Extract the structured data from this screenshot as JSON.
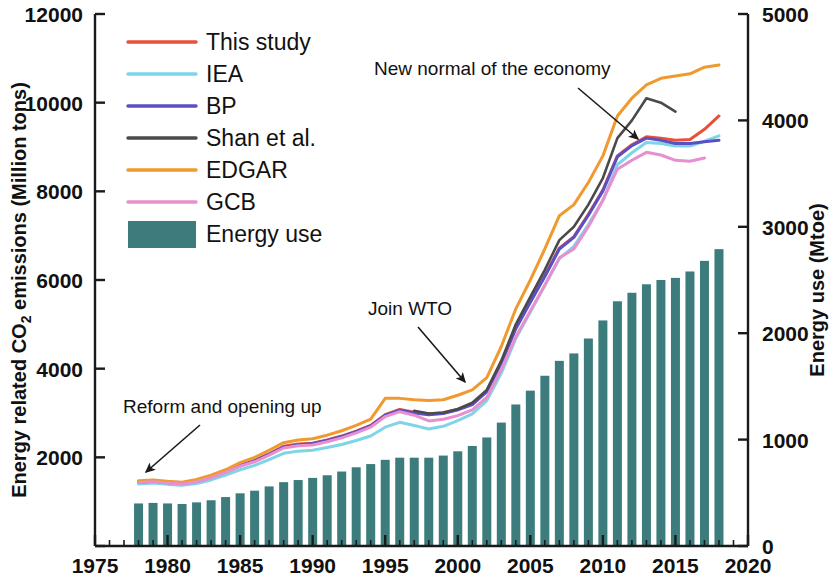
{
  "chart_data": {
    "type": "line",
    "title": "",
    "xlabel": "",
    "ylabel": "Energy related CO2 emissions (Million tons)",
    "y2label": "Energy use (Mtoe)",
    "xlim": [
      1975,
      2020
    ],
    "ylim": [
      0,
      12000
    ],
    "y2lim": [
      0,
      5000
    ],
    "xticks": [
      1975,
      1980,
      1985,
      1990,
      1995,
      2000,
      2005,
      2010,
      2015,
      2020
    ],
    "yticks": [
      0,
      2000,
      4000,
      6000,
      8000,
      10000,
      12000
    ],
    "y2ticks": [
      0,
      1000,
      2000,
      3000,
      4000,
      5000
    ],
    "grid": false,
    "legend_position": "top-left",
    "bars": {
      "name": "Energy use",
      "unit": "Mtoe",
      "axis": "right",
      "color": "#3d7c7c",
      "x": [
        1978,
        1979,
        1980,
        1981,
        1982,
        1983,
        1984,
        1985,
        1986,
        1987,
        1988,
        1989,
        1990,
        1991,
        1992,
        1993,
        1994,
        1995,
        1996,
        1997,
        1998,
        1999,
        2000,
        2001,
        2002,
        2003,
        2004,
        2005,
        2006,
        2007,
        2008,
        2009,
        2010,
        2011,
        2012,
        2013,
        2014,
        2015,
        2016,
        2017,
        2018
      ],
      "values": [
        400,
        405,
        400,
        395,
        410,
        430,
        460,
        495,
        520,
        560,
        600,
        620,
        640,
        665,
        700,
        740,
        770,
        810,
        830,
        830,
        830,
        850,
        890,
        940,
        1020,
        1160,
        1330,
        1460,
        1600,
        1740,
        1810,
        1950,
        2120,
        2300,
        2380,
        2460,
        2500,
        2520,
        2580,
        2680,
        2790
      ]
    },
    "series": [
      {
        "name": "This study",
        "color": "#e8503a",
        "axis": "left",
        "x": [
          1978,
          1979,
          1980,
          1981,
          1982,
          1983,
          1984,
          1985,
          1986,
          1987,
          1988,
          1989,
          1990,
          1991,
          1992,
          1993,
          1994,
          1995,
          1996,
          1997,
          1998,
          1999,
          2000,
          2001,
          2002,
          2003,
          2004,
          2005,
          2006,
          2007,
          2008,
          2009,
          2010,
          2011,
          2012,
          2013,
          2014,
          2015,
          2016,
          2017,
          2018
        ],
        "values": [
          1450,
          1470,
          1440,
          1420,
          1470,
          1560,
          1680,
          1820,
          1930,
          2080,
          2250,
          2300,
          2320,
          2390,
          2480,
          2590,
          2720,
          2960,
          3080,
          3020,
          2980,
          3000,
          3080,
          3200,
          3490,
          4140,
          4920,
          5520,
          6100,
          6720,
          6980,
          7480,
          8030,
          8800,
          9050,
          9230,
          9200,
          9150,
          9170,
          9400,
          9700
        ]
      },
      {
        "name": "IEA",
        "color": "#7fd4e8",
        "axis": "left",
        "x": [
          1978,
          1979,
          1980,
          1981,
          1982,
          1983,
          1984,
          1985,
          1986,
          1987,
          1988,
          1989,
          1990,
          1991,
          1992,
          1993,
          1994,
          1995,
          1996,
          1997,
          1998,
          1999,
          2000,
          2001,
          2002,
          2003,
          2004,
          2005,
          2006,
          2007,
          2008,
          2009,
          2010,
          2011,
          2012,
          2013,
          2014,
          2015,
          2016,
          2017,
          2018
        ],
        "values": [
          1400,
          1420,
          1390,
          1370,
          1410,
          1490,
          1600,
          1720,
          1820,
          1950,
          2090,
          2140,
          2160,
          2220,
          2290,
          2380,
          2480,
          2680,
          2790,
          2720,
          2640,
          2700,
          2830,
          2980,
          3280,
          3900,
          4680,
          5280,
          5880,
          6480,
          6760,
          7250,
          7800,
          8600,
          8870,
          9100,
          9080,
          9020,
          9020,
          9130,
          9250
        ]
      },
      {
        "name": "BP",
        "color": "#5b4fc4",
        "axis": "left",
        "x": [
          1978,
          1979,
          1980,
          1981,
          1982,
          1983,
          1984,
          1985,
          1986,
          1987,
          1988,
          1989,
          1990,
          1991,
          1992,
          1993,
          1994,
          1995,
          1996,
          1997,
          1998,
          1999,
          2000,
          2001,
          2002,
          2003,
          2004,
          2005,
          2006,
          2007,
          2008,
          2009,
          2010,
          2011,
          2012,
          2013,
          2014,
          2015,
          2016,
          2017,
          2018
        ],
        "values": [
          1440,
          1460,
          1430,
          1410,
          1460,
          1550,
          1670,
          1810,
          1920,
          2070,
          2230,
          2280,
          2310,
          2380,
          2470,
          2580,
          2710,
          2950,
          3060,
          3000,
          2960,
          2990,
          3070,
          3190,
          3480,
          4130,
          4900,
          5500,
          6080,
          6700,
          6960,
          7460,
          8010,
          8780,
          9030,
          9200,
          9150,
          9080,
          9080,
          9120,
          9150
        ]
      },
      {
        "name": "Shan et al.",
        "color": "#4a4a4a",
        "axis": "left",
        "x": [
          1997,
          1998,
          1999,
          2000,
          2001,
          2002,
          2003,
          2004,
          2005,
          2006,
          2007,
          2008,
          2009,
          2010,
          2011,
          2012,
          2013,
          2014,
          2015
        ],
        "values": [
          3050,
          2990,
          3010,
          3090,
          3230,
          3520,
          4180,
          5000,
          5620,
          6230,
          6900,
          7200,
          7700,
          8300,
          9200,
          9600,
          10100,
          10000,
          9800
        ]
      },
      {
        "name": "EDGAR",
        "color": "#f0992e",
        "axis": "left",
        "x": [
          1978,
          1979,
          1980,
          1981,
          1982,
          1983,
          1984,
          1985,
          1986,
          1987,
          1988,
          1989,
          1990,
          1991,
          1992,
          1993,
          1994,
          1995,
          1996,
          1997,
          1998,
          1999,
          2000,
          2001,
          2002,
          2003,
          2004,
          2005,
          2006,
          2007,
          2008,
          2009,
          2010,
          2011,
          2012,
          2013,
          2014,
          2015,
          2016,
          2017,
          2018
        ],
        "values": [
          1470,
          1490,
          1460,
          1440,
          1500,
          1600,
          1720,
          1880,
          2000,
          2160,
          2330,
          2390,
          2420,
          2500,
          2600,
          2720,
          2860,
          3330,
          3330,
          3300,
          3280,
          3300,
          3400,
          3520,
          3800,
          4500,
          5350,
          6000,
          6700,
          7450,
          7700,
          8200,
          8800,
          9700,
          10100,
          10400,
          10550,
          10600,
          10650,
          10800,
          10850
        ]
      },
      {
        "name": "GCB",
        "color": "#e88fd0",
        "axis": "left",
        "x": [
          1978,
          1979,
          1980,
          1981,
          1982,
          1983,
          1984,
          1985,
          1986,
          1987,
          1988,
          1989,
          1990,
          1991,
          1992,
          1993,
          1994,
          1995,
          1996,
          1997,
          1998,
          1999,
          2000,
          2001,
          2002,
          2003,
          2004,
          2005,
          2006,
          2007,
          2008,
          2009,
          2010,
          2011,
          2012,
          2013,
          2014,
          2015,
          2016,
          2017
        ],
        "values": [
          1430,
          1450,
          1420,
          1400,
          1450,
          1540,
          1660,
          1800,
          1900,
          2050,
          2210,
          2260,
          2280,
          2350,
          2440,
          2550,
          2680,
          2920,
          3030,
          2950,
          2820,
          2860,
          2940,
          3070,
          3350,
          3980,
          4720,
          5300,
          5880,
          6500,
          6700,
          7200,
          7800,
          8500,
          8700,
          8880,
          8820,
          8700,
          8680,
          8750
        ]
      }
    ],
    "annotations": [
      {
        "text": "Reform and opening up",
        "label_x": 123,
        "label_y": 413,
        "arrow_from_x": 200,
        "arrow_from_y": 425,
        "arrow_to_x": 146,
        "arrow_to_y": 472
      },
      {
        "text": "Join WTO",
        "label_x": 368,
        "label_y": 315,
        "arrow_from_x": 418,
        "arrow_from_y": 327,
        "arrow_to_x": 465,
        "arrow_to_y": 382
      },
      {
        "text": "New normal of the economy",
        "label_x": 374,
        "label_y": 75,
        "arrow_from_x": 578,
        "arrow_from_y": 88,
        "arrow_to_x": 638,
        "arrow_to_y": 139
      }
    ],
    "legend_entries": [
      {
        "label": "This study",
        "color": "#e8503a",
        "marker": "line"
      },
      {
        "label": "IEA",
        "color": "#7fd4e8",
        "marker": "line"
      },
      {
        "label": "BP",
        "color": "#5b4fc4",
        "marker": "line"
      },
      {
        "label": "Shan et al.",
        "color": "#4a4a4a",
        "marker": "line"
      },
      {
        "label": "EDGAR",
        "color": "#f0992e",
        "marker": "line"
      },
      {
        "label": "GCB",
        "color": "#e88fd0",
        "marker": "line"
      },
      {
        "label": "Energy use",
        "color": "#3d7c7c",
        "marker": "patch"
      }
    ]
  },
  "axes": {
    "left_title_part1": "Energy related CO",
    "left_title_sub": "2",
    "left_title_part2": " emissions (Million tons)",
    "right_title": "Energy use (Mtoe)"
  }
}
